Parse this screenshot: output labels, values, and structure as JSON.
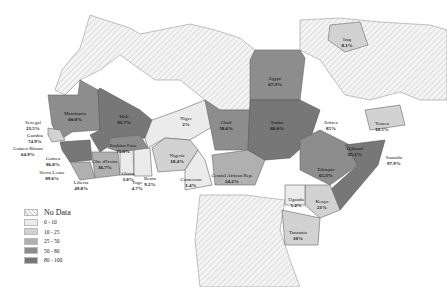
{
  "legend": {
    "items": [
      {
        "label": "No Data",
        "color": "#f3f3f3",
        "hatched": true
      },
      {
        "label": "0 - 10",
        "color": "#ebebeb"
      },
      {
        "label": "10 - 25",
        "color": "#d2d2d2"
      },
      {
        "label": "25 - 50",
        "color": "#b0b0b0"
      },
      {
        "label": "50 - 80",
        "color": "#8d8d8d"
      },
      {
        "label": "80 - 100",
        "color": "#777777"
      }
    ]
  },
  "countries": [
    {
      "name": "Senegal",
      "value": "23.5%",
      "x": 33,
      "y": 120,
      "outside": true
    },
    {
      "name": "Gambia",
      "value": "74.9%",
      "x": 35,
      "y": 133,
      "outside": true
    },
    {
      "name": "Guinea-Bissau",
      "value": "64.9%",
      "x": 28,
      "y": 146,
      "outside": true
    },
    {
      "name": "Guinea",
      "value": "86.8%",
      "x": 53,
      "y": 156,
      "outside": true
    },
    {
      "name": "Sierra Leone",
      "value": "89.6%",
      "x": 52,
      "y": 170,
      "outside": true
    },
    {
      "name": "Liberia",
      "value": "49.8%",
      "x": 81,
      "y": 180,
      "outside": true
    },
    {
      "name": "Mauritania",
      "value": "60.0%",
      "x": 75,
      "y": 111
    },
    {
      "name": "Mali",
      "value": "91.7%",
      "x": 124,
      "y": 114
    },
    {
      "name": "Burkina Faso",
      "value": "75.0%",
      "x": 123,
      "y": 143
    },
    {
      "name": "Côte d'Ivoire",
      "value": "36.7%",
      "x": 105,
      "y": 159
    },
    {
      "name": "Ghana",
      "value": "3.8%",
      "x": 128,
      "y": 171
    },
    {
      "name": "Togo",
      "value": "4.7%",
      "x": 137,
      "y": 180
    },
    {
      "name": "Benin",
      "value": "9.2%",
      "x": 150,
      "y": 176
    },
    {
      "name": "Niger",
      "value": "2%",
      "x": 186,
      "y": 116
    },
    {
      "name": "Nigeria",
      "value": "18.4%",
      "x": 177,
      "y": 153
    },
    {
      "name": "Cameroon",
      "value": "1.4%",
      "x": 191,
      "y": 177
    },
    {
      "name": "Chad",
      "value": "58.6%",
      "x": 226,
      "y": 120
    },
    {
      "name": "Central African Rep.",
      "value": "24.2%",
      "x": 232,
      "y": 173
    },
    {
      "name": "Sudan",
      "value": "86.0%",
      "x": 277,
      "y": 120
    },
    {
      "name": "Egypt",
      "value": "67.3%",
      "x": 275,
      "y": 76
    },
    {
      "name": "Iraq",
      "value": "8.1%",
      "x": 347,
      "y": 37
    },
    {
      "name": "Eritrea",
      "value": "85%",
      "x": 331,
      "y": 120
    },
    {
      "name": "Yemen",
      "value": "18.5%",
      "x": 382,
      "y": 121
    },
    {
      "name": "Djibouti",
      "value": "85.1%",
      "x": 355,
      "y": 146
    },
    {
      "name": "Somalia",
      "value": "97.9%",
      "x": 394,
      "y": 155
    },
    {
      "name": "Ethiopia",
      "value": "65.3%",
      "x": 326,
      "y": 167
    },
    {
      "name": "Uganda",
      "value": "1.4%",
      "x": 296,
      "y": 197
    },
    {
      "name": "Kenya",
      "value": "21%",
      "x": 322,
      "y": 199
    },
    {
      "name": "Tanzania",
      "value": "10%",
      "x": 298,
      "y": 230
    }
  ]
}
